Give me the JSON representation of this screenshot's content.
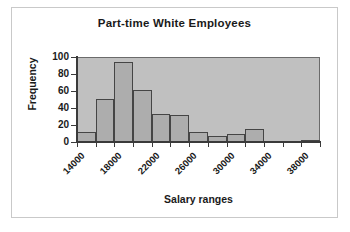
{
  "chart_data": {
    "type": "bar",
    "title": "Part-time White Employees",
    "xlabel": "Salary ranges",
    "ylabel": "Frequency",
    "categories": [
      "14000",
      "16000",
      "18000",
      "20000",
      "22000",
      "24000",
      "26000",
      "28000",
      "30000",
      "32000",
      "34000",
      "36000",
      "38000"
    ],
    "values": [
      12,
      51,
      94,
      61,
      33,
      32,
      12,
      7,
      10,
      15,
      0,
      0,
      1
    ],
    "bin_width": 2000,
    "x_tick_labels": [
      "14000",
      "",
      "18000",
      "",
      "22000",
      "",
      "26000",
      "",
      "30000",
      "",
      "34000",
      "",
      "38000",
      ""
    ],
    "x_tick_values": [
      14000,
      16000,
      18000,
      20000,
      22000,
      24000,
      26000,
      28000,
      30000,
      32000,
      34000,
      36000,
      38000,
      40000
    ],
    "xlim": [
      14000,
      40000
    ],
    "ylim": [
      0,
      100
    ],
    "y_ticks": [
      0,
      20,
      40,
      60,
      80,
      100
    ],
    "y_tick_labels": [
      "0",
      "20",
      "40",
      "60",
      "80",
      "100"
    ],
    "grid": false,
    "legend": false,
    "bar_fill_color": "#adadad",
    "bar_edge_color": "#454545",
    "plot_background_color": "#c0c0c0",
    "figure_background_color": "#ffffff",
    "axis_color": "#3a3a3a",
    "text_color": "#1a1a1a",
    "frame_border_color": "#c9c9c9"
  }
}
